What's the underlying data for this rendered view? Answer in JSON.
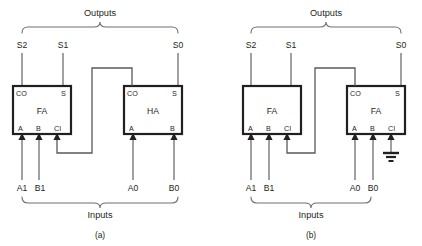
{
  "figure": {
    "background_color": "#ffffff",
    "outline_color": "#231f20",
    "wire_color": "#6d6e71",
    "panels": [
      {
        "id": "panel-a",
        "caption": "(a)",
        "outputs_group_label": "Outputs",
        "inputs_group_label": "Inputs",
        "output_signals": [
          "S2",
          "S1",
          "S0"
        ],
        "input_signals": [
          "A1",
          "B1",
          "A0",
          "B0"
        ],
        "blocks": [
          {
            "id": "block-a-left",
            "name": "FA",
            "top_pins": [
              "CO",
              "S"
            ],
            "bottom_pins": [
              "A",
              "B",
              "CI"
            ]
          },
          {
            "id": "block-a-right",
            "name": "HA",
            "top_pins": [
              "CO",
              "S"
            ],
            "bottom_pins": [
              "A",
              "B"
            ]
          }
        ],
        "carry_connection": {
          "from": "HA.CO",
          "to": "FA.CI"
        },
        "has_ground": false
      },
      {
        "id": "panel-b",
        "caption": "(b)",
        "outputs_group_label": "Outputs",
        "inputs_group_label": "Inputs",
        "output_signals": [
          "S2",
          "S1",
          "S0"
        ],
        "input_signals": [
          "A1",
          "B1",
          "A0",
          "B0"
        ],
        "blocks": [
          {
            "id": "block-b-left",
            "name": "FA",
            "top_pins": [],
            "bottom_pins": [
              "A",
              "B",
              "CI"
            ]
          },
          {
            "id": "block-b-right",
            "name": "FA",
            "top_pins": [
              "CO",
              "S"
            ],
            "bottom_pins": [
              "A",
              "B",
              "CI"
            ]
          }
        ],
        "carry_connection": {
          "from": "FA.CO",
          "to": "FA.CI"
        },
        "has_ground": true,
        "ground_pin": "CI"
      }
    ]
  }
}
